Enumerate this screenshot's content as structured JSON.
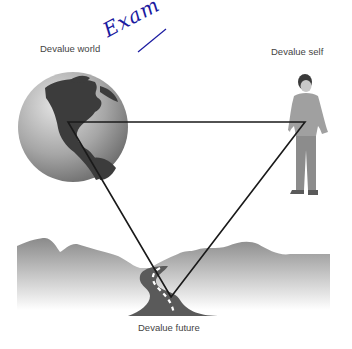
{
  "diagram": {
    "labels": {
      "world": "Devalue world",
      "self": "Devalue self",
      "future": "Devalue future"
    },
    "annotation": "Exam",
    "nodes": [
      {
        "id": "world",
        "label": "Devalue world",
        "icon": "globe-icon"
      },
      {
        "id": "self",
        "label": "Devalue self",
        "icon": "person-icon"
      },
      {
        "id": "future",
        "label": "Devalue future",
        "icon": "road-icon"
      }
    ],
    "edges": [
      {
        "from": "world",
        "to": "self"
      },
      {
        "from": "self",
        "to": "future"
      },
      {
        "from": "future",
        "to": "world"
      }
    ],
    "colors": {
      "triangle": "#1a1a1a",
      "globe_ocean": "#a8a8a8",
      "globe_land": "#3c3c3c",
      "hills": "#8c8c8c",
      "road": "#5a5a5a",
      "annotation": "#1a1aa0"
    }
  }
}
